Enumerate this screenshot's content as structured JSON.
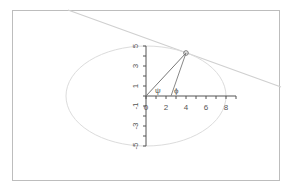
{
  "diagram": {
    "title": "",
    "colors": {
      "frame": "#bdbdbd",
      "axis": "#555555",
      "ellipse": "#d8d8d8",
      "tangent": "#d0d0d0",
      "rays": "#777777",
      "point": "#777777",
      "labels": "#555555"
    },
    "x_axis": {
      "tick_labels": [
        "0",
        "2",
        "4",
        "6",
        "8"
      ],
      "range": [
        0,
        9
      ]
    },
    "y_axis": {
      "tick_labels": [
        "5",
        "3",
        "1",
        "-1",
        "-3",
        "-5"
      ],
      "range": [
        -5,
        5
      ]
    },
    "ellipse": {
      "cx": 0,
      "cy": 0,
      "a": 8,
      "b": 5
    },
    "point": {
      "x": 4,
      "y": 4.33
    },
    "focus_like_point": {
      "x": 2.5,
      "y": 0
    },
    "angle_labels": {
      "psi": "ψ",
      "phi": "ϕ"
    }
  }
}
